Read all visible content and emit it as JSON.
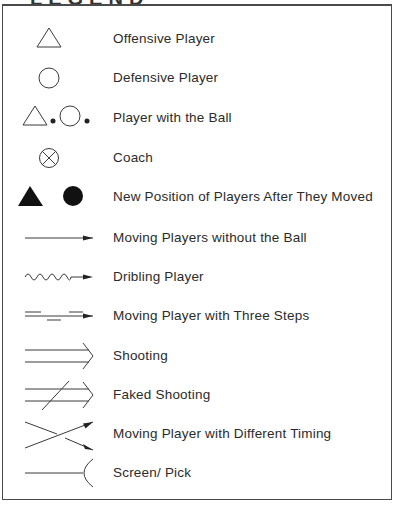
{
  "title": "LEGEND",
  "legend": {
    "items": [
      {
        "symbol": "hollow-triangle",
        "label": "Offensive Player"
      },
      {
        "symbol": "hollow-circle",
        "label": "Defensive Player"
      },
      {
        "symbol": "triangle-circle-with-ball-dots",
        "label": "Player with the Ball"
      },
      {
        "symbol": "circled-x",
        "label": "Coach"
      },
      {
        "symbol": "filled-triangle-and-circle",
        "label": "New Position of Players After They Moved"
      },
      {
        "symbol": "straight-arrow",
        "label": "Moving Players without the Ball"
      },
      {
        "symbol": "wavy-arrow",
        "label": "Dribling Player"
      },
      {
        "symbol": "dashed-steps-arrow",
        "label": "Moving Player with Three Steps"
      },
      {
        "symbol": "double-line-chevron",
        "label": "Shooting"
      },
      {
        "symbol": "double-line-chevron-slashed",
        "label": "Faked Shooting"
      },
      {
        "symbol": "crossed-arrows",
        "label": "Moving Player with Different Timing"
      },
      {
        "symbol": "line-with-arc",
        "label": "Screen/ Pick"
      }
    ]
  },
  "colors": {
    "stroke": "#3a3a3a",
    "border": "#4a4a4a",
    "text": "#2b2b2b"
  }
}
